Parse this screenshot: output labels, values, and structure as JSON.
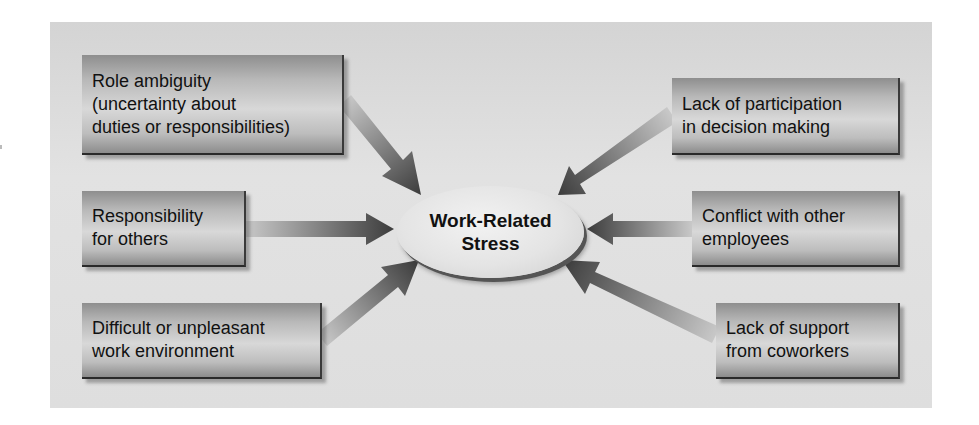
{
  "diagram": {
    "center": {
      "line1": "Work-Related",
      "line2": "Stress"
    },
    "left_factors": [
      {
        "lines": [
          "Role ambiguity",
          "(uncertainty about",
          "duties or responsibilities)"
        ]
      },
      {
        "lines": [
          "Responsibility",
          "for others"
        ]
      },
      {
        "lines": [
          "Difficult or unpleasant",
          "work environment"
        ]
      }
    ],
    "right_factors": [
      {
        "lines": [
          "Lack of participation",
          "in decision making"
        ]
      },
      {
        "lines": [
          "Conflict with other",
          "employees"
        ]
      },
      {
        "lines": [
          "Lack of support",
          "from coworkers"
        ]
      }
    ],
    "colors": {
      "panel_background": "#dcdcdc",
      "box_dark": "#8c8c8c",
      "box_light": "#d8d8d8",
      "arrow_dark": "#3c3c3c",
      "arrow_light": "#c8c8c8",
      "text": "#111111"
    }
  }
}
